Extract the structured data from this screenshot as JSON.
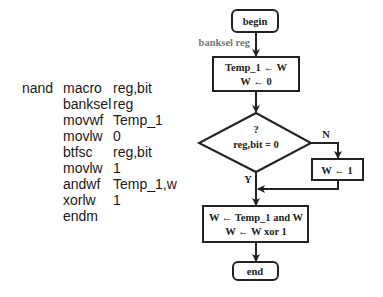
{
  "code_listing": {
    "label": "nand",
    "lines": [
      {
        "op": "macro",
        "arg": "reg,bit"
      },
      {
        "op": "banksel",
        "arg": "reg"
      },
      {
        "op": "movwf",
        "arg": "Temp_1"
      },
      {
        "op": "movlw",
        "arg": "0"
      },
      {
        "op": "btfsc",
        "arg": "reg,bit"
      },
      {
        "op": "movlw",
        "arg": "1"
      },
      {
        "op": "andwf",
        "arg": "Temp_1,w"
      },
      {
        "op": "xorlw",
        "arg": "1"
      },
      {
        "op": "endm",
        "arg": ""
      }
    ]
  },
  "flowchart": {
    "begin": "begin",
    "side_note": "banksel reg",
    "process1": {
      "line1": "Temp_1 ← W",
      "line2": "W ← 0"
    },
    "decision": {
      "line1": "?",
      "line2": "reg,bit = 0"
    },
    "branch_no_label": "N",
    "branch_yes_label": "Y",
    "process_no": "W ← 1",
    "process2": {
      "line1": "W ← Temp_1 and W",
      "line2": "W ← W xor 1"
    },
    "end": "end"
  }
}
